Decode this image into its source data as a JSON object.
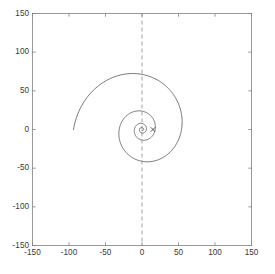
{
  "chart_data": {
    "type": "line",
    "title": "",
    "subtitle": "",
    "xlabel": "",
    "ylabel": "",
    "xlim": [
      -150,
      150
    ],
    "ylim": [
      -150,
      150
    ],
    "xticks": [
      -150,
      -100,
      -50,
      0,
      50,
      100,
      150
    ],
    "yticks": [
      -150,
      -100,
      -50,
      0,
      50,
      100,
      150
    ],
    "xticklabels": [
      "-150",
      "-100",
      "-50",
      "0",
      "50",
      "100",
      "150"
    ],
    "yticklabels": [
      "-150",
      "-100",
      "-50",
      "0",
      "50",
      "100",
      "150"
    ],
    "grid": false,
    "legend": null,
    "box": true,
    "tick_direction": "in",
    "axis_color": "#808080",
    "series": [
      {
        "name": "logarithmic-spiral",
        "type": "parametric-polar",
        "color": "#3c3c3c",
        "linewidth": 0.7,
        "linestyle": "solid",
        "description": "Outward logarithmic spiral r = a*exp(b*theta) starting near the origin and growing to a radius of about 120; makes roughly four visible revolutions with each turn about three times larger than the previous one.",
        "model": {
          "form": "r = a * exp(b * theta)",
          "a": 2.0,
          "b": 0.175,
          "theta_start_deg": -90,
          "theta_end_deg": 1260,
          "theta_step_deg": 1.5,
          "center": [
            0,
            0
          ],
          "orientation": "counterclockwise-outward",
          "theta_zero_at": "positive-x-axis"
        },
        "extents": {
          "max_radius": 120,
          "leftmost_x": -130,
          "rightmost_x": 105,
          "topmost_y": 120,
          "bottommost_y": -120
        },
        "loops": [
          {
            "index": 1,
            "approx_radius": 4
          },
          {
            "index": 2,
            "approx_radius": 13
          },
          {
            "index": 3,
            "approx_radius": 40
          },
          {
            "index": 4,
            "approx_radius": 120
          }
        ]
      },
      {
        "name": "vertical-reference-line",
        "type": "vline",
        "x": 0,
        "color": "#8c8c8c",
        "linewidth": 0.8,
        "linestyle": "dashed",
        "dash_pattern": "4,3",
        "description": "Dashed vertical reference line at x = 0 spanning the full vertical axis range."
      },
      {
        "name": "marker-x",
        "type": "scatter",
        "marker": "x",
        "color": "#2b2b2b",
        "size": 4.5,
        "points": [
          {
            "x": 15,
            "y": 0
          }
        ],
        "description": "Small x-shaped marker located on the horizontal axis just right of the origin."
      }
    ]
  },
  "figure": {
    "background": "#ffffff",
    "plot_background": "#ffffff",
    "width_px": 275,
    "height_px": 274
  }
}
